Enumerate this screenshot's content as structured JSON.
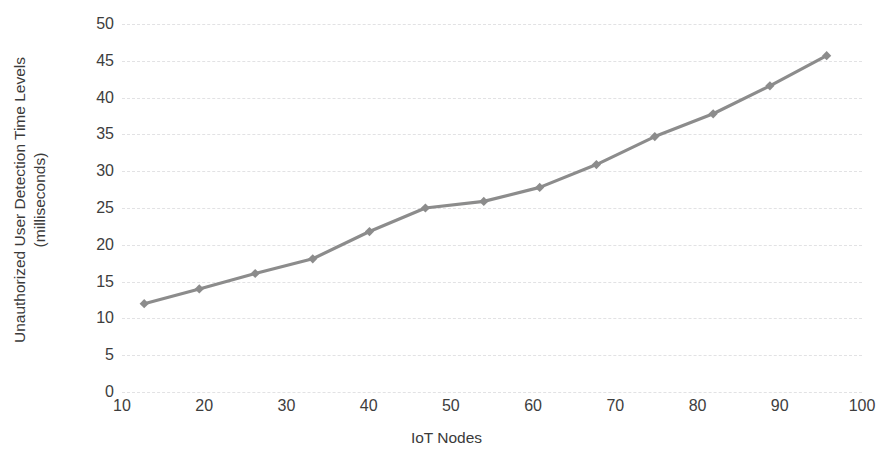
{
  "chart_data": {
    "type": "line",
    "title": "",
    "xlabel": "IoT Nodes",
    "ylabel": "Unauthorized User Detection Time Levels (milliseconds)",
    "ylabel_line1": "Unauthorized User Detection Time Levels",
    "ylabel_line2": "(milliseconds)",
    "xlim": [
      10,
      100
    ],
    "ylim": [
      0,
      50
    ],
    "xticks": [
      10,
      20,
      30,
      40,
      50,
      60,
      70,
      80,
      90,
      100
    ],
    "yticks": [
      0,
      5,
      10,
      15,
      20,
      25,
      30,
      35,
      40,
      45,
      50
    ],
    "xtick_labels": [
      "10",
      "20",
      "30",
      "40",
      "50",
      "60",
      "70",
      "80",
      "90",
      "100"
    ],
    "ytick_labels": [
      "0",
      "5",
      "10",
      "15",
      "20",
      "25",
      "30",
      "35",
      "40",
      "45",
      "50"
    ],
    "grid": true,
    "grid_axis": "y",
    "grid_style": "dashed",
    "legend": false,
    "legend_position": "none",
    "marker": "diamond",
    "series": [
      {
        "name": "Unauthorized User Detection Time",
        "color": "#8c8c8c",
        "x": [
          12.7,
          19.4,
          26.2,
          33.2,
          40.1,
          46.9,
          54.0,
          60.8,
          67.7,
          74.8,
          81.9,
          88.8,
          95.7
        ],
        "values": [
          12.0,
          14.0,
          16.1,
          18.1,
          21.8,
          25.0,
          25.9,
          27.8,
          30.9,
          34.7,
          37.8,
          41.6,
          45.7
        ]
      }
    ]
  },
  "colors": {
    "series": "#8c8c8c",
    "marker": "#8c8c8c",
    "gridline": "#e2e2e4",
    "tick_text": "#3d3d3d",
    "axis_title_text": "#3a3a3a",
    "background": "#ffffff"
  }
}
